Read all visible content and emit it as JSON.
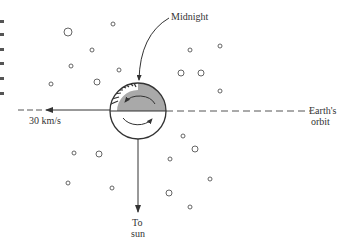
{
  "diagram": {
    "type": "astronomy-schematic",
    "labels": {
      "midnight": "Midnight",
      "velocity": "30 km/s",
      "orbit_line1": "Earth's",
      "orbit_line2": "orbit",
      "sun_line1": "To",
      "sun_line2": "sun"
    },
    "earth": {
      "cx": 138,
      "cy": 111,
      "r": 28,
      "night_fill": "#a9a9a9",
      "day_fill": "#ffffff",
      "stroke": "#333333"
    },
    "colors": {
      "ink": "#333333",
      "star_stroke": "#555555",
      "background": "#ffffff"
    },
    "stars": [
      {
        "x": 68,
        "y": 32,
        "r": 4
      },
      {
        "x": 113,
        "y": 24,
        "r": 2
      },
      {
        "x": 92,
        "y": 50,
        "r": 2
      },
      {
        "x": 71,
        "y": 66,
        "r": 2
      },
      {
        "x": 51,
        "y": 84,
        "r": 2
      },
      {
        "x": 97,
        "y": 82,
        "r": 3
      },
      {
        "x": 119,
        "y": 70,
        "r": 2
      },
      {
        "x": 190,
        "y": 50,
        "r": 2
      },
      {
        "x": 220,
        "y": 46,
        "r": 2
      },
      {
        "x": 181,
        "y": 73,
        "r": 3
      },
      {
        "x": 201,
        "y": 73,
        "r": 3
      },
      {
        "x": 220,
        "y": 91,
        "r": 2
      },
      {
        "x": 183,
        "y": 136,
        "r": 2
      },
      {
        "x": 195,
        "y": 149,
        "r": 3
      },
      {
        "x": 170,
        "y": 159,
        "r": 2
      },
      {
        "x": 210,
        "y": 179,
        "r": 2
      },
      {
        "x": 169,
        "y": 193,
        "r": 3
      },
      {
        "x": 190,
        "y": 207,
        "r": 2
      },
      {
        "x": 74,
        "y": 153,
        "r": 2
      },
      {
        "x": 99,
        "y": 154,
        "r": 3
      },
      {
        "x": 68,
        "y": 183,
        "r": 2
      },
      {
        "x": 112,
        "y": 188,
        "r": 2
      }
    ]
  }
}
